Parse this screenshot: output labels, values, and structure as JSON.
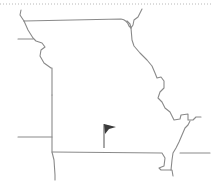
{
  "map": {
    "region": "Missouri",
    "marker": {
      "type": "flag",
      "icon": "flag-icon",
      "color": "#3a3a3a",
      "position": {
        "x": 103,
        "y": 128
      }
    },
    "colors": {
      "border": "#8a8a8a",
      "background": "#ffffff",
      "dotted_line": "#b8b8b8"
    }
  }
}
